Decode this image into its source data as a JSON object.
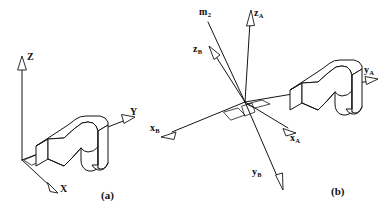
{
  "figure": {
    "background_color": "#ffffff",
    "line_color": "#141414",
    "width": 388,
    "height": 217,
    "panels": [
      {
        "id": "panel-a",
        "caption": "(a)",
        "description": "Single reference frame with an L-shaped bracket solid",
        "axes": [
          {
            "name": "z-axis",
            "label": "Z",
            "sub": "",
            "direction": "up"
          },
          {
            "name": "y-axis",
            "label": "Y",
            "sub": "",
            "direction": "right"
          },
          {
            "name": "x-axis",
            "label": "X",
            "sub": "",
            "direction": "down-right"
          }
        ]
      },
      {
        "id": "panel-b",
        "caption": "(b)",
        "description": "Two superimposed reference frames A and B with an extra vector, plus the bracket solid",
        "axes": [
          {
            "name": "m2-vector",
            "label": "m",
            "sub": "2",
            "direction": "up-left"
          },
          {
            "name": "za-axis",
            "label": "z",
            "sub": "A",
            "direction": "up"
          },
          {
            "name": "zb-axis",
            "label": "z",
            "sub": "B",
            "direction": "up-left"
          },
          {
            "name": "xb-axis",
            "label": "x",
            "sub": "B",
            "direction": "left-down"
          },
          {
            "name": "xa-axis",
            "label": "x",
            "sub": "A",
            "direction": "right-down"
          },
          {
            "name": "yb-axis",
            "label": "y",
            "sub": "B",
            "direction": "down-right"
          },
          {
            "name": "ya-axis",
            "label": "y",
            "sub": "A",
            "direction": "right"
          }
        ]
      }
    ]
  }
}
